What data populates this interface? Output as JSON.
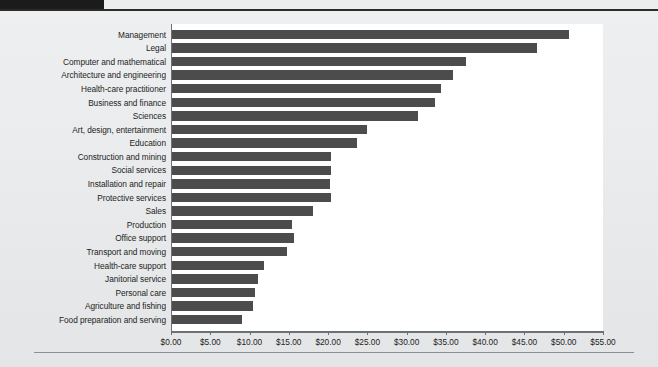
{
  "figure": {
    "title": "",
    "axis_color": "#6e7173",
    "bar_color": "#4c4c4c",
    "plot_background": "#ffffff",
    "page_background": "#eceded"
  },
  "chart_data": {
    "type": "bar",
    "orientation": "horizontal",
    "title": "",
    "subtitle": "",
    "xlabel": "",
    "ylabel": "",
    "xlim": [
      0,
      55
    ],
    "ylim": null,
    "grid": false,
    "legend": null,
    "tick_format": "$0.00",
    "xticks": [
      0,
      5,
      10,
      15,
      20,
      25,
      30,
      35,
      40,
      45,
      50,
      55
    ],
    "xtick_labels": [
      "$0.00",
      "$5.00",
      "$10.00",
      "$15.00",
      "$20.00",
      "$25.00",
      "$30.00",
      "$35.00",
      "$40.00",
      "$45.00",
      "$50.00",
      "$55.00"
    ],
    "categories": [
      "Management",
      "Legal",
      "Computer and mathematical",
      "Architecture and engineering",
      "Health-care practitioner",
      "Business and finance",
      "Sciences",
      "Art, design, entertainment",
      "Education",
      "Construction and mining",
      "Social services",
      "Installation and repair",
      "Protective services",
      "Sales",
      "Production",
      "Office support",
      "Transport and moving",
      "Health-care support",
      "Janitorial service",
      "Personal care",
      "Agriculture and fishing",
      "Food preparation and serving"
    ],
    "values": [
      50.6,
      46.5,
      37.4,
      35.8,
      34.3,
      33.5,
      31.3,
      24.8,
      23.5,
      20.3,
      20.2,
      20.1,
      20.2,
      18.0,
      15.3,
      15.5,
      14.6,
      11.7,
      11.0,
      10.6,
      10.3,
      8.9
    ],
    "series": [
      {
        "name": "Median hourly wage",
        "values": [
          50.6,
          46.5,
          37.4,
          35.8,
          34.3,
          33.5,
          31.3,
          24.8,
          23.5,
          20.3,
          20.2,
          20.1,
          20.2,
          18.0,
          15.3,
          15.5,
          14.6,
          11.7,
          11.0,
          10.6,
          10.3,
          8.9
        ]
      }
    ]
  }
}
